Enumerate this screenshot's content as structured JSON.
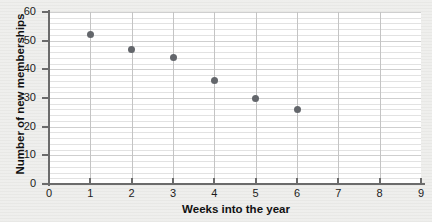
{
  "chart_data": {
    "type": "scatter",
    "title": "",
    "xlabel": "Weeks into the year",
    "ylabel": "Number of new memberships",
    "xlim": [
      0,
      9
    ],
    "ylim": [
      0,
      60
    ],
    "xticks": [
      "0",
      "1",
      "2",
      "3",
      "4",
      "5",
      "6",
      "7",
      "8",
      "9"
    ],
    "xtick_values": [
      0,
      1,
      2,
      3,
      4,
      5,
      6,
      7,
      8,
      9
    ],
    "yticks": [
      "0",
      "10",
      "20",
      "30",
      "40",
      "50",
      "60"
    ],
    "ytick_values": [
      0,
      10,
      20,
      30,
      40,
      50,
      60
    ],
    "grid": true,
    "grid_minor_y_step": 2,
    "legend": "none",
    "x": [
      1,
      2,
      3,
      4,
      5,
      6
    ],
    "y": [
      52,
      47,
      44,
      36,
      30,
      26
    ],
    "points": [
      {
        "x": 1,
        "y": 52
      },
      {
        "x": 2,
        "y": 47
      },
      {
        "x": 3,
        "y": 44
      },
      {
        "x": 4,
        "y": 36
      },
      {
        "x": 5,
        "y": 30
      },
      {
        "x": 6,
        "y": 26
      }
    ],
    "marker_color": "#63666b",
    "plot_background": "#ffffff",
    "figure_background": "#e4e4e1",
    "axis_color": "#6b6b6b"
  }
}
